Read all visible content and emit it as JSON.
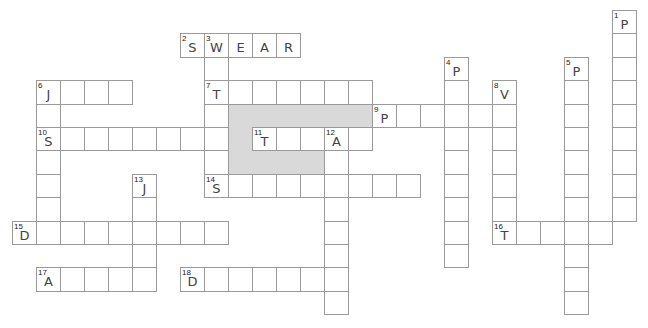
{
  "puzzle": {
    "type": "crossword",
    "grid": {
      "origin_x": 12,
      "origin_y": 10,
      "cell_w": 24,
      "cell_h": 23.4
    },
    "colors": {
      "border": "#9a9a9a",
      "shade": "#d9d9d9",
      "letter": "#444444",
      "number": "#222222",
      "background": "#ffffff"
    },
    "shaded_regions": [
      {
        "row": 4,
        "col_start": 9,
        "col_end": 14
      },
      {
        "row": 5,
        "col_start": 9,
        "col_end": 9
      },
      {
        "row": 6,
        "col_start": 9,
        "col_end": 12
      }
    ],
    "entries": [
      {
        "number": 1,
        "direction": "down",
        "row": 0,
        "col": 25,
        "length": 9,
        "letters": "P"
      },
      {
        "number": 2,
        "direction": "across",
        "row": 1,
        "col": 7,
        "length": 5,
        "letters": "SWEAR"
      },
      {
        "number": 3,
        "direction": "down",
        "row": 1,
        "col": 8,
        "length": 7,
        "letters": "W"
      },
      {
        "number": 4,
        "direction": "down",
        "row": 2,
        "col": 18,
        "length": 9,
        "letters": "P"
      },
      {
        "number": 5,
        "direction": "down",
        "row": 2,
        "col": 23,
        "length": 11,
        "letters": "P"
      },
      {
        "number": 6,
        "direction": "across",
        "row": 3,
        "col": 1,
        "length": 4,
        "letters": "J"
      },
      {
        "number": 6,
        "direction": "down",
        "row": 3,
        "col": 1,
        "length": 7,
        "letters": "J"
      },
      {
        "number": 7,
        "direction": "across",
        "row": 3,
        "col": 8,
        "length": 7,
        "letters": "T"
      },
      {
        "number": 8,
        "direction": "down",
        "row": 3,
        "col": 20,
        "length": 7,
        "letters": "V"
      },
      {
        "number": 9,
        "direction": "across",
        "row": 4,
        "col": 15,
        "length": 6,
        "letters": "P"
      },
      {
        "number": 10,
        "direction": "across",
        "row": 5,
        "col": 1,
        "length": 8,
        "letters": "S"
      },
      {
        "number": 11,
        "direction": "across",
        "row": 5,
        "col": 10,
        "length": 5,
        "letters": "T"
      },
      {
        "number": 12,
        "direction": "down",
        "row": 5,
        "col": 13,
        "length": 8,
        "letters": "A"
      },
      {
        "number": 13,
        "direction": "down",
        "row": 7,
        "col": 5,
        "length": 5,
        "letters": "J"
      },
      {
        "number": 14,
        "direction": "across",
        "row": 7,
        "col": 8,
        "length": 9,
        "letters": "S"
      },
      {
        "number": 15,
        "direction": "across",
        "row": 9,
        "col": 0,
        "length": 9,
        "letters": "D"
      },
      {
        "number": 16,
        "direction": "across",
        "row": 9,
        "col": 20,
        "length": 5,
        "letters": "T"
      },
      {
        "number": 17,
        "direction": "across",
        "row": 11,
        "col": 1,
        "length": 5,
        "letters": "A"
      },
      {
        "number": 18,
        "direction": "across",
        "row": 11,
        "col": 7,
        "length": 7,
        "letters": "D"
      }
    ]
  }
}
